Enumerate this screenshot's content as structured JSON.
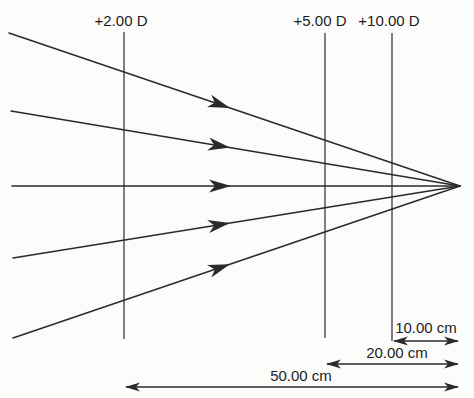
{
  "diagram": {
    "canvas": {
      "width": 474,
      "height": 398,
      "background": "#fcfcfb",
      "line_color": "#2a2a2a",
      "text_color": "#1c1c1c"
    },
    "focal_point": {
      "x": 460,
      "y": 186
    },
    "rays": [
      {
        "x1": 9,
        "y1": 33,
        "arrow_x": 230
      },
      {
        "x1": 11,
        "y1": 111,
        "arrow_x": 230
      },
      {
        "x1": 12,
        "y1": 186,
        "arrow_x": 231
      },
      {
        "x1": 13,
        "y1": 258,
        "arrow_x": 230
      },
      {
        "x1": 13,
        "y1": 338,
        "arrow_x": 230
      }
    ],
    "lenses": [
      {
        "label": "+2.00 D",
        "x": 124,
        "y_top": 32,
        "y_bottom": 339,
        "label_x": 121,
        "label_y": 26
      },
      {
        "label": "+5.00 D",
        "x": 325,
        "y_top": 33,
        "y_bottom": 338,
        "label_x": 320,
        "label_y": 26
      },
      {
        "label": "+10.00 D",
        "x": 392,
        "y_top": 33,
        "y_bottom": 341,
        "label_x": 389,
        "label_y": 26
      }
    ],
    "dimensions": [
      {
        "label": "10.00 cm",
        "x1": 393,
        "x2": 459,
        "y": 341,
        "label_x": 426,
        "label_y": 333
      },
      {
        "label": "20.00 cm",
        "x1": 326,
        "x2": 459,
        "y": 364,
        "label_x": 397,
        "label_y": 358
      },
      {
        "label": "50.00 cm",
        "x1": 125,
        "x2": 459,
        "y": 387,
        "label_x": 301,
        "label_y": 381
      }
    ]
  }
}
